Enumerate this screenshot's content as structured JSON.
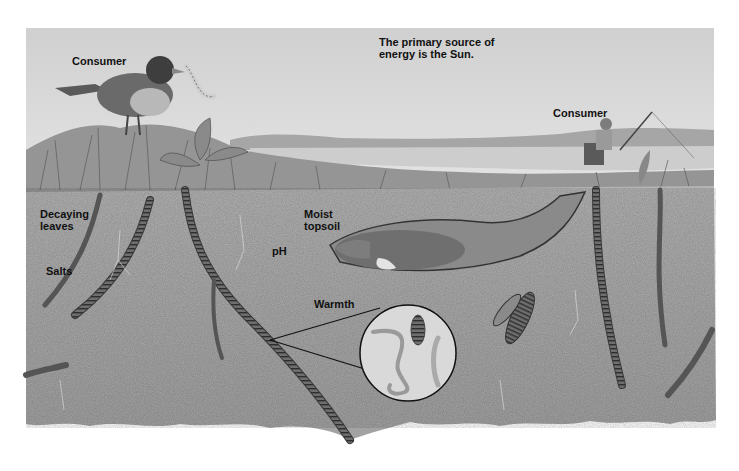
{
  "diagram": {
    "type": "soil ecosystem illustration",
    "colors": {
      "sky": "#d6d6d6",
      "soil": "#a9a9a9",
      "soil_dark": "#8e8e8e",
      "grass": "#9a9a9a",
      "water": "#c9c9c9",
      "worm": "#5a5a5a",
      "outline": "#1a1a1a",
      "background": "#ffffff"
    },
    "labels": {
      "sun_note": "The primary source of\nenergy is the Sun.",
      "consumer_bird": "Consumer",
      "consumer_fisherman": "Consumer",
      "decaying_leaves": "Decaying\nleaves",
      "salts": "Salts",
      "moist_topsoil": "Moist\ntopsoil",
      "ph": "pH",
      "warmth": "Warmth"
    },
    "elements": [
      "bird-with-worm",
      "fisherman-on-chair",
      "lake",
      "distant-hills",
      "grass-layer",
      "mole-in-burrow",
      "earthworms",
      "insect-larvae",
      "magnified-circle-nematodes"
    ]
  }
}
